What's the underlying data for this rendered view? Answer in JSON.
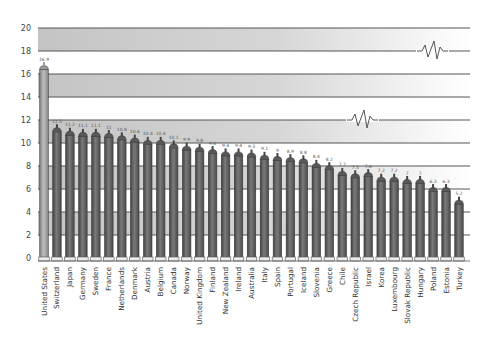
{
  "chart_data": {
    "type": "bar",
    "title": "",
    "xlabel": "",
    "ylabel": "",
    "ylim": [
      0,
      20
    ],
    "yticks": [
      0,
      2,
      4,
      6,
      8,
      10,
      12,
      14,
      16,
      18,
      20
    ],
    "grid": true,
    "legend": null,
    "categories": [
      "United States",
      "Switzerland",
      "Japan",
      "Germany",
      "Sweden",
      "France",
      "Netherlands",
      "Denmark",
      "Austria",
      "Belgium",
      "Canada",
      "Norway",
      "United Kingdom",
      "Finland",
      "New Zealand",
      "Ireland",
      "Australia",
      "Italy",
      "Spain",
      "Portugal",
      "Iceland",
      "Slovenia",
      "Greece",
      "Chile",
      "Czech Republic",
      "Israel",
      "Korea",
      "Luxembourg",
      "Slovak Republic",
      "Hungary",
      "Poland",
      "Estonia",
      "Turkey"
    ],
    "values": [
      16.9,
      11.5,
      11.2,
      11.1,
      11.1,
      11,
      10.8,
      10.6,
      10.4,
      10.4,
      10.1,
      9.9,
      9.8,
      9.6,
      9.4,
      9.4,
      9.3,
      9.1,
      9,
      8.9,
      8.8,
      8.4,
      8.2,
      7.7,
      7.5,
      7.6,
      7.2,
      7.2,
      7,
      7,
      6.3,
      6.3,
      5.2
    ],
    "value_labels": [
      "16.9",
      "11.5",
      "11.2",
      "11.1",
      "11.1",
      "11",
      "10.8",
      "10.6",
      "10.4",
      "10.4",
      "10.1",
      "9.9",
      "9.8",
      "9.6",
      "9.4",
      "9.4",
      "9.3",
      "9.1",
      "9",
      "8.9",
      "8.8",
      "8.4",
      "8.2",
      "7.7",
      "7.5",
      "7.6",
      "7.2",
      "7.2",
      "7",
      "7",
      "6.3",
      "6.3",
      "5.2"
    ],
    "highlight_index": 0,
    "annotations": [
      "axis-break squiggle at y=18",
      "axis-break squiggle at y=12"
    ]
  },
  "colors": {
    "bar": "#6b6b6b",
    "bar_dark": "#4a4a4a",
    "bar_highlight": "#a9a9a9",
    "band_gray": "#cfcfcf",
    "band_white": "#ffffff",
    "gridline": "#555555"
  }
}
